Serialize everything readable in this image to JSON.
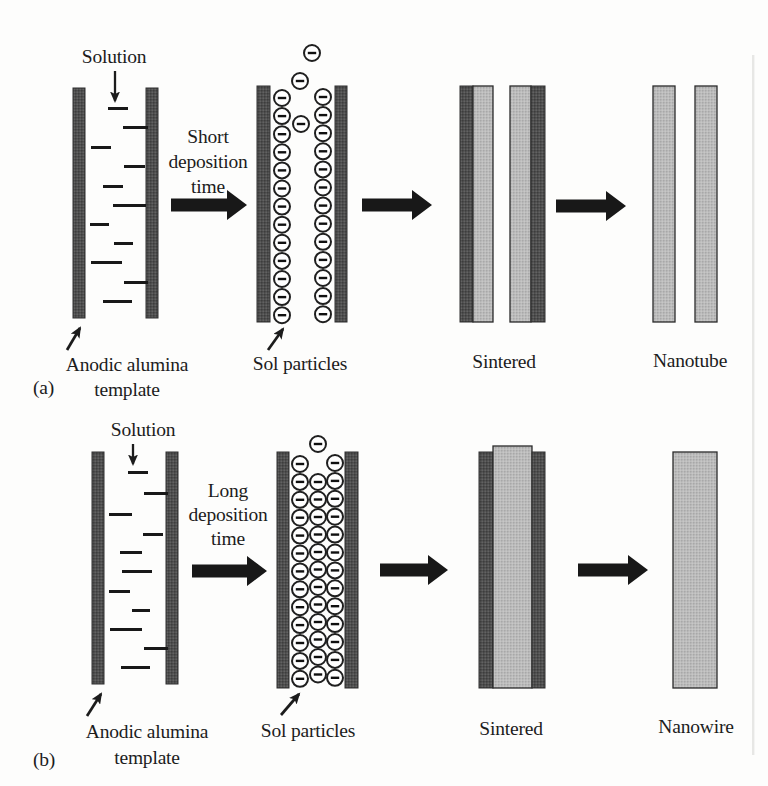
{
  "figure": {
    "description_visible_text_only": true,
    "colors": {
      "background": "#fdfdfc",
      "ink": "#1c1c1c",
      "wall_gray": "#4e4e4e",
      "deposit_gray": "#b9b9b9",
      "particle_fill": "#ffffff"
    },
    "panels": [
      {
        "id": "a",
        "index_label": "(a)",
        "index_pos": {
          "x": 33,
          "y": 394
        },
        "solution": {
          "label": "Solution",
          "cx": 114,
          "y": 63,
          "arrow": {
            "x": 115,
            "y1": 71,
            "y2": 101
          }
        },
        "template": {
          "walls": [
            {
              "x": 73,
              "y": 88,
              "w": 12,
              "h": 230
            },
            {
              "x": 146,
              "y": 88,
              "w": 12,
              "h": 230
            }
          ],
          "dashes": [
            {
              "x": 108,
              "y": 107,
              "w": 20
            },
            {
              "x": 123,
              "y": 126,
              "w": 25
            },
            {
              "x": 91,
              "y": 146,
              "w": 20
            },
            {
              "x": 124,
              "y": 165,
              "w": 21
            },
            {
              "x": 103,
              "y": 185,
              "w": 20
            },
            {
              "x": 113,
              "y": 204,
              "w": 33
            },
            {
              "x": 90,
              "y": 223,
              "w": 19
            },
            {
              "x": 114,
              "y": 242,
              "w": 19
            },
            {
              "x": 91,
              "y": 261,
              "w": 31
            },
            {
              "x": 124,
              "y": 281,
              "w": 24
            },
            {
              "x": 103,
              "y": 300,
              "w": 29
            }
          ],
          "pointer": {
            "x1": 67,
            "y1": 350,
            "x2": 80,
            "y2": 328
          },
          "caption_lines": [
            "Anodic alumina",
            "template"
          ],
          "caption_cx": 127,
          "caption_ys": [
            371,
            396
          ]
        },
        "step": {
          "lines": [
            "Short",
            "deposition",
            "time"
          ],
          "cx": 208,
          "ys": [
            143,
            168,
            193
          ]
        },
        "arrows": [
          {
            "x": 171,
            "cy": 205,
            "len": 76
          },
          {
            "x": 362,
            "cy": 205,
            "len": 70
          },
          {
            "x": 556,
            "cy": 206,
            "len": 70
          }
        ],
        "sol": {
          "walls": [
            {
              "x": 257,
              "y": 86,
              "w": 13,
              "h": 236
            },
            {
              "x": 335,
              "y": 86,
              "w": 12,
              "h": 236
            }
          ],
          "columns": [
            {
              "cx": 282,
              "y0": 98,
              "n": 13,
              "dy": 18.1
            },
            {
              "cx": 323,
              "y0": 97,
              "n": 13,
              "dy": 18.1
            }
          ],
          "free": [
            {
              "cx": 312,
              "cy": 53
            },
            {
              "cx": 300,
              "cy": 81
            },
            {
              "cx": 301,
              "cy": 124
            }
          ],
          "r": 8,
          "pointer": {
            "x1": 268,
            "y1": 350,
            "x2": 283,
            "y2": 329
          },
          "caption": "Sol particles",
          "caption_cx": 300,
          "caption_y": 370
        },
        "sintered": {
          "bars": [
            {
              "x": 460,
              "y": 86,
              "w": 13,
              "h": 236,
              "kind": "wall"
            },
            {
              "x": 473,
              "y": 86,
              "w": 20,
              "h": 236,
              "kind": "deposit"
            },
            {
              "x": 510,
              "y": 86,
              "w": 21,
              "h": 236,
              "kind": "deposit"
            },
            {
              "x": 531,
              "y": 86,
              "w": 14,
              "h": 236,
              "kind": "wall"
            }
          ],
          "caption": "Sintered",
          "caption_cx": 504,
          "caption_y": 368
        },
        "product": {
          "bars": [
            {
              "x": 653,
              "y": 86,
              "w": 22,
              "h": 236
            },
            {
              "x": 695,
              "y": 86,
              "w": 22,
              "h": 236
            }
          ],
          "caption": "Nanotube",
          "caption_cx": 690,
          "caption_y": 367
        }
      },
      {
        "id": "b",
        "index_label": "(b)",
        "index_pos": {
          "x": 33,
          "y": 766
        },
        "solution": {
          "label": "Solution",
          "cx": 143,
          "y": 436,
          "arrow": {
            "x": 133,
            "y1": 444,
            "y2": 464
          }
        },
        "template": {
          "walls": [
            {
              "x": 92,
              "y": 452,
              "w": 12,
              "h": 232
            },
            {
              "x": 166,
              "y": 452,
              "w": 12,
              "h": 232
            }
          ],
          "dashes": [
            {
              "x": 128,
              "y": 471,
              "w": 20
            },
            {
              "x": 144,
              "y": 492,
              "w": 24
            },
            {
              "x": 109,
              "y": 513,
              "w": 23
            },
            {
              "x": 143,
              "y": 533,
              "w": 20
            },
            {
              "x": 120,
              "y": 551,
              "w": 22
            },
            {
              "x": 122,
              "y": 570,
              "w": 30
            },
            {
              "x": 109,
              "y": 590,
              "w": 21
            },
            {
              "x": 132,
              "y": 609,
              "w": 18
            },
            {
              "x": 110,
              "y": 628,
              "w": 32
            },
            {
              "x": 144,
              "y": 647,
              "w": 24
            },
            {
              "x": 121,
              "y": 666,
              "w": 29
            }
          ],
          "pointer": {
            "x1": 87,
            "y1": 716,
            "x2": 101,
            "y2": 694
          },
          "caption_lines": [
            "Anodic alumina",
            "template"
          ],
          "caption_cx": 147,
          "caption_ys": [
            738,
            764
          ]
        },
        "step": {
          "lines": [
            "Long",
            "deposition",
            "time"
          ],
          "cx": 228,
          "ys": [
            497,
            521,
            545
          ]
        },
        "arrows": [
          {
            "x": 192,
            "cy": 571,
            "len": 75
          },
          {
            "x": 380,
            "cy": 570,
            "len": 68
          },
          {
            "x": 578,
            "cy": 570,
            "len": 70
          }
        ],
        "sol": {
          "walls": [
            {
              "x": 277,
              "y": 452,
              "w": 12,
              "h": 236
            },
            {
              "x": 345,
              "y": 452,
              "w": 13,
              "h": 236
            }
          ],
          "columns": [
            {
              "cx": 300,
              "y0": 464,
              "n": 13,
              "dy": 17.9
            },
            {
              "cx": 318,
              "y0": 482,
              "n": 12,
              "dy": 17.5
            },
            {
              "cx": 335,
              "y0": 463,
              "n": 13,
              "dy": 17.9
            }
          ],
          "free": [
            {
              "cx": 318,
              "cy": 444
            }
          ],
          "r": 8,
          "pointer": {
            "x1": 281,
            "y1": 715,
            "x2": 299,
            "y2": 694
          },
          "caption": "Sol particles",
          "caption_cx": 308,
          "caption_y": 737
        },
        "sintered": {
          "bars": [
            {
              "x": 479,
              "y": 452,
              "w": 14,
              "h": 236,
              "kind": "wall"
            },
            {
              "x": 493,
              "y": 446,
              "w": 39,
              "h": 242,
              "kind": "deposit"
            },
            {
              "x": 532,
              "y": 452,
              "w": 13,
              "h": 236,
              "kind": "wall"
            }
          ],
          "caption": "Sintered",
          "caption_cx": 511,
          "caption_y": 735
        },
        "product": {
          "bars": [
            {
              "x": 673,
              "y": 452,
              "w": 44,
              "h": 236
            }
          ],
          "caption": "Nanowire",
          "caption_cx": 696,
          "caption_y": 733
        }
      }
    ]
  }
}
